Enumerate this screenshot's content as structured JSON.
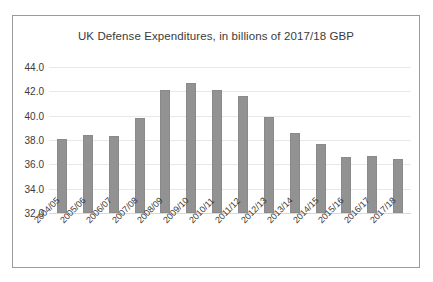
{
  "chart_data": {
    "type": "bar",
    "title": "UK Defense Expenditures, in billions of 2017/18 GBP",
    "xlabel": "",
    "ylabel": "",
    "ylim": [
      32.0,
      44.0
    ],
    "yticks": [
      "32.0",
      "34.0",
      "36.0",
      "38.0",
      "40.0",
      "42.0",
      "44.0"
    ],
    "ytick_values": [
      32.0,
      34.0,
      36.0,
      38.0,
      40.0,
      42.0,
      44.0
    ],
    "grid": true,
    "legend": "none",
    "bar_color": "#929292",
    "categories": [
      "2004/05",
      "2005/06",
      "2006/07",
      "2007/08",
      "2008/09",
      "2009/10",
      "2010/11",
      "2011/12",
      "2012/13",
      "2013/14",
      "2014/15",
      "2015/16",
      "2016/17",
      "2017/18"
    ],
    "values": [
      38.1,
      38.4,
      38.3,
      39.8,
      42.1,
      42.7,
      42.1,
      41.6,
      39.9,
      38.6,
      37.7,
      36.6,
      36.65,
      36.45
    ]
  }
}
